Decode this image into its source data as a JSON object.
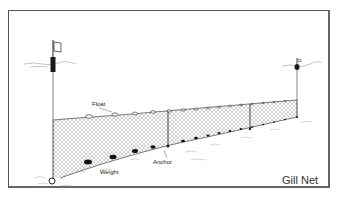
{
  "diagram": {
    "title": "Gill Net",
    "labels": {
      "float": "Float",
      "weight": "Weight",
      "anchor": "Anchor"
    },
    "components": [
      {
        "name": "marker-buoy-left",
        "type": "flag buoy"
      },
      {
        "name": "marker-buoy-right",
        "type": "buoy"
      },
      {
        "name": "float-line",
        "type": "floats"
      },
      {
        "name": "net-mesh",
        "type": "mesh"
      },
      {
        "name": "lead-line",
        "type": "weights"
      },
      {
        "name": "anchors",
        "type": "anchor"
      }
    ],
    "colors": {
      "line": "#222222",
      "mesh": "#888888",
      "frame": "#555555",
      "background": "#ffffff"
    }
  }
}
